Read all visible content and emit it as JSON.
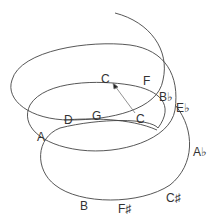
{
  "diagram": {
    "colors": {
      "line": "#444444",
      "text": "#333333",
      "arrow": "#777777"
    },
    "notes": [
      {
        "id": "c-top",
        "label": "C",
        "x": 101,
        "y": 73
      },
      {
        "id": "f",
        "label": "F",
        "x": 143,
        "y": 75
      },
      {
        "id": "bflat",
        "label": "B♭",
        "x": 159,
        "y": 91
      },
      {
        "id": "eflat",
        "label": "E♭",
        "x": 176,
        "y": 102
      },
      {
        "id": "d",
        "label": "D",
        "x": 64,
        "y": 114
      },
      {
        "id": "g",
        "label": "G",
        "x": 92,
        "y": 110
      },
      {
        "id": "c-mid",
        "label": "C",
        "x": 136,
        "y": 113
      },
      {
        "id": "a",
        "label": "A",
        "x": 37,
        "y": 131
      },
      {
        "id": "aflat",
        "label": "A♭",
        "x": 193,
        "y": 146
      },
      {
        "id": "csharp",
        "label": "C♯",
        "x": 166,
        "y": 192
      },
      {
        "id": "b",
        "label": "B",
        "x": 80,
        "y": 200
      },
      {
        "id": "fsharp",
        "label": "F♯",
        "x": 118,
        "y": 203
      }
    ]
  }
}
